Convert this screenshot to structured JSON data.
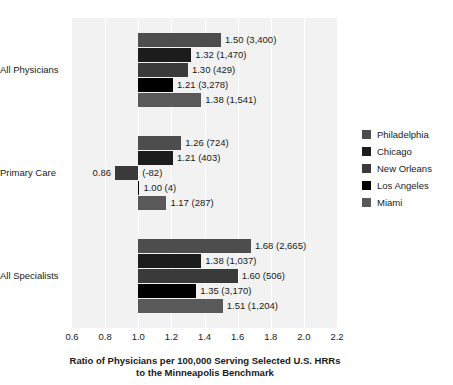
{
  "chart_data": {
    "type": "bar",
    "orientation": "horizontal",
    "title": "",
    "xlabel": "Ratio of Physicians per 100,000 Serving Selected U.S. HRRs to the Minneapolis Benchmark",
    "xlabel_line1": "Ratio of Physicians per 100,000 Serving Selected U.S. HRRs",
    "xlabel_line2": "to the Minneapolis Benchmark",
    "ylabel": "",
    "xlim": [
      0.6,
      2.2
    ],
    "reference_line": 1.0,
    "grid": true,
    "legend_position": "right",
    "tick_labels": [
      "0.6",
      "0.8",
      "1.0",
      "1.2",
      "1.4",
      "1.6",
      "1.8",
      "2.0",
      "2.2"
    ],
    "tick_values": [
      0.6,
      0.8,
      1.0,
      1.2,
      1.4,
      1.6,
      1.8,
      2.0,
      2.2
    ],
    "categories": [
      "All Physicians",
      "Primary Care",
      "All Specialists"
    ],
    "series": [
      {
        "name": "Philadelphia",
        "color": "#4d4d4d",
        "values": [
          1.5,
          1.26,
          1.68
        ],
        "counts": [
          3400,
          724,
          2665
        ],
        "labels": [
          "1.50 (3,400)",
          "1.26 (724)",
          "1.68 (2,665)"
        ]
      },
      {
        "name": "Chicago",
        "color": "#1c1c1c",
        "values": [
          1.32,
          1.21,
          1.38
        ],
        "counts": [
          1470,
          403,
          1037
        ],
        "labels": [
          "1.32 (1,470)",
          "1.21 (403)",
          "1.38 (1,037)"
        ]
      },
      {
        "name": "New Orleans",
        "color": "#3a3a3a",
        "values": [
          1.3,
          0.86,
          1.6
        ],
        "counts": [
          429,
          -82,
          506
        ],
        "labels": [
          "1.30 (429)",
          "(-82)",
          "1.60 (506)"
        ],
        "value_labels": [
          "",
          "0.86",
          ""
        ]
      },
      {
        "name": "Los Angeles",
        "color": "#000000",
        "values": [
          1.21,
          1.0,
          1.35
        ],
        "counts": [
          3278,
          4,
          3170
        ],
        "labels": [
          "1.21 (3,278)",
          "1.00 (4)",
          "1.35 (3,170)"
        ]
      },
      {
        "name": "Miami",
        "color": "#595959",
        "values": [
          1.38,
          1.17,
          1.51
        ],
        "counts": [
          1541,
          287,
          1204
        ],
        "labels": [
          "1.38 (1,541)",
          "1.17 (287)",
          "1.51 (1,204)"
        ]
      }
    ]
  },
  "legend": {
    "items": [
      {
        "label": "Philadelphia",
        "color": "#4d4d4d"
      },
      {
        "label": "Chicago",
        "color": "#1c1c1c"
      },
      {
        "label": "New Orleans",
        "color": "#3a3a3a"
      },
      {
        "label": "Los Angeles",
        "color": "#000000"
      },
      {
        "label": "Miami",
        "color": "#595959"
      }
    ]
  },
  "axis": {
    "title_line1": "Ratio of Physicians per 100,000 Serving Selected U.S. HRRs",
    "title_line2": "to the Minneapolis Benchmark"
  }
}
